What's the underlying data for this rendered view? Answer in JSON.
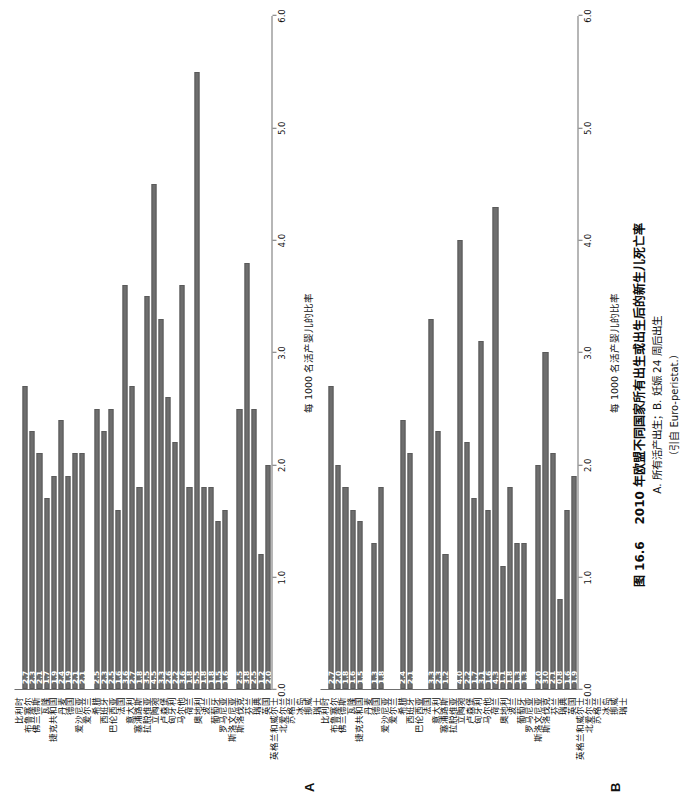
{
  "figure": {
    "number": "图 16.6",
    "caption_main": "2010 年欧盟不同国家所有出生或出生后的新生儿死亡率",
    "caption_sub": "A. 所有活产出生；B. 妊娠 24 周后出生",
    "caption_source": "（引自 Euro-peristat.）"
  },
  "chart_data": {
    "type": "bar",
    "title": "2010 年欧盟不同国家所有出生或出生后的新生儿死亡率",
    "orientation": "horizontal",
    "xlabel": "每 1000 名活产婴儿的比率",
    "ylabel": "",
    "xlim": [
      0.0,
      6.0
    ],
    "xticks": [
      "0.0",
      "1.0",
      "2.0",
      "3.0",
      "4.0",
      "5.0",
      "6.0"
    ],
    "grid": false,
    "legend": null,
    "bar_color": "#6e6e6e",
    "categories": [
      "比利时",
      "布鲁塞尔",
      "佛兰德斯",
      "瓦隆",
      "捷克共和国",
      "丹麦",
      "德国",
      "爱沙尼亚",
      "爱尔兰",
      "希腊",
      "西班牙",
      "巴伦西亚",
      "法国",
      "意大利",
      "塞浦路斯",
      "拉脱维亚",
      "立陶宛",
      "卢森堡",
      "匈牙利",
      "马尔他",
      "荷兰",
      "奥地利",
      "波兰",
      "葡萄牙",
      "罗马尼亚",
      "斯洛文尼亚",
      "斯洛伐克",
      "芬兰",
      "瑞典",
      "英国",
      "英格兰和威尔士",
      "北爱尔兰",
      "苏格兰",
      "冰岛",
      "挪威",
      "瑞士"
    ],
    "panels": [
      {
        "letter": "A",
        "subtitle": "所有活产出生",
        "xlabel": "每 1000 名活产婴儿的比率",
        "values": [
          null,
          2.7,
          2.3,
          2.1,
          1.7,
          1.9,
          2.4,
          1.9,
          2.1,
          2.1,
          null,
          2.5,
          2.3,
          2.5,
          1.6,
          3.6,
          2.7,
          1.8,
          3.5,
          4.5,
          3.3,
          2.6,
          2.2,
          3.6,
          1.8,
          5.5,
          1.8,
          1.8,
          1.5,
          1.6,
          null,
          2.5,
          3.8,
          2.5,
          1.2,
          2.0,
          2.6
        ],
        "labels": [
          "",
          "2.7",
          "2.3",
          "2.1",
          "1.7",
          "1.9",
          "2.4",
          "1.9",
          "2.1",
          "2.1",
          "",
          "2.5",
          "2.3",
          "2.5",
          "1.6",
          "3.6",
          "2.7",
          "1.8",
          "3.5",
          "4.5",
          "3.3",
          "2.6",
          "2.2",
          "3.6",
          "1.8",
          "5.5",
          "1.8",
          "1.8",
          "1.5",
          "1.6",
          "",
          "2.5",
          "3.8",
          "2.5",
          "1.2",
          "2.0",
          "2.6"
        ]
      },
      {
        "letter": "B",
        "subtitle": "妊娠 24 周后出生",
        "xlabel": "每 1000 名活产婴儿的比率",
        "values": [
          null,
          2.7,
          2.0,
          1.8,
          1.6,
          1.5,
          null,
          1.3,
          1.8,
          null,
          null,
          2.4,
          2.1,
          null,
          null,
          3.3,
          2.3,
          1.2,
          null,
          4.0,
          2.2,
          1.7,
          3.1,
          1.6,
          4.3,
          1.1,
          1.8,
          1.3,
          1.3,
          null,
          2.0,
          3.0,
          2.1,
          0.8,
          1.6,
          1.9
        ],
        "labels": [
          "",
          "2.7",
          "2.0",
          "1.8",
          "1.6",
          "1.5",
          "",
          "1.3",
          "1.8",
          "",
          "",
          "2.4",
          "2.1",
          "",
          "",
          "3.3",
          "2.3",
          "1.2",
          "",
          "4.0",
          "2.2",
          "1.7",
          "3.1",
          "1.6",
          "4.3",
          "1.1",
          "1.8",
          "1.3",
          "1.3",
          "",
          "2.0",
          "3.0",
          "2.1",
          "0.8",
          "1.6",
          "1.9"
        ]
      }
    ]
  }
}
